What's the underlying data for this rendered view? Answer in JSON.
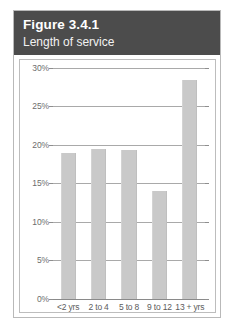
{
  "figure": {
    "title": "Figure 3.4.1",
    "subtitle": "Length of service",
    "header_bg": "#4c4c4c",
    "bar_color": "#c9c9c9",
    "grid_color": "#a9a9a9"
  },
  "chart_data": {
    "type": "bar",
    "title": "Figure 3.4.1",
    "subtitle": "Length of service",
    "xlabel": "",
    "ylabel": "",
    "categories": [
      "<2 yrs",
      "2 to 4",
      "5 to 8",
      "9 to 12",
      "13 + yrs"
    ],
    "values": [
      19,
      19.5,
      19.3,
      14,
      28.5
    ],
    "value_labels": [
      "19%",
      "19.5%",
      "19.3%",
      "14%",
      "28.5%"
    ],
    "ylim": [
      0,
      30
    ],
    "ytick_values": [
      0,
      5,
      10,
      15,
      20,
      25,
      30
    ],
    "ytick_labels": [
      "0%",
      "5%",
      "10%",
      "15%",
      "20%",
      "25%",
      "30%"
    ],
    "grid": true,
    "grid_axis": "y",
    "legend": false,
    "legend_position": "none"
  }
}
